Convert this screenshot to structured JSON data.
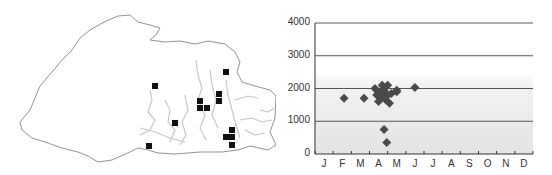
{
  "map": {
    "description": "Outline map with grey drainage network and black square markers",
    "marker_color": "#111111",
    "outline_color": "#777777",
    "river_color": "#c8c8c8",
    "markers": [
      [
        155,
        86
      ],
      [
        226,
        72
      ],
      [
        219,
        94
      ],
      [
        219,
        101
      ],
      [
        200,
        101
      ],
      [
        200,
        108
      ],
      [
        207,
        108
      ],
      [
        175,
        123
      ],
      [
        232,
        130
      ],
      [
        226,
        137
      ],
      [
        232,
        137
      ],
      [
        232,
        145
      ],
      [
        149,
        146
      ]
    ]
  },
  "chart_data": {
    "type": "scatter",
    "title": "",
    "xlabel": "",
    "ylabel": "",
    "categories": [
      "J",
      "F",
      "M",
      "A",
      "M",
      "J",
      "J",
      "A",
      "S",
      "O",
      "N",
      "D"
    ],
    "yticks": [
      0,
      1000,
      2000,
      3000,
      4000
    ],
    "ylim": [
      0,
      4000
    ],
    "xlim": [
      0,
      12
    ],
    "grid": "horizontal",
    "band_shading": [
      0,
      2500
    ],
    "marker": "diamond",
    "marker_color": "#4a4a4a",
    "series": [
      {
        "name": "observations",
        "points": [
          {
            "month": 1.6,
            "value": 1700
          },
          {
            "month": 2.7,
            "value": 1700
          },
          {
            "month": 3.3,
            "value": 2000
          },
          {
            "month": 3.4,
            "value": 1800
          },
          {
            "month": 3.5,
            "value": 1600
          },
          {
            "month": 3.5,
            "value": 1900
          },
          {
            "month": 3.6,
            "value": 1700
          },
          {
            "month": 3.7,
            "value": 2100
          },
          {
            "month": 3.7,
            "value": 1850
          },
          {
            "month": 3.8,
            "value": 1950
          },
          {
            "month": 3.9,
            "value": 1750
          },
          {
            "month": 3.9,
            "value": 1650
          },
          {
            "month": 4.0,
            "value": 2100
          },
          {
            "month": 4.0,
            "value": 1800
          },
          {
            "month": 4.1,
            "value": 1550
          },
          {
            "month": 4.2,
            "value": 1850
          },
          {
            "month": 4.5,
            "value": 1900
          },
          {
            "month": 4.5,
            "value": 1950
          },
          {
            "month": 5.5,
            "value": 2030
          },
          {
            "month": 3.8,
            "value": 750
          },
          {
            "month": 3.95,
            "value": 350
          }
        ]
      }
    ]
  }
}
